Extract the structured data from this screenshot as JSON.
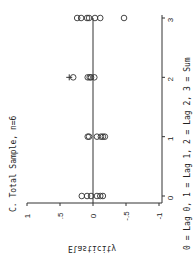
{
  "chart_data": {
    "type": "scatter",
    "orientation": "rotated-90-ccw",
    "title": "C. Total Sample, n=6",
    "xlabel": "0 = Lag 0, 1 = Lag 1, 2 = Lag 2, 3 = Sum",
    "ylabel": "Elasticity",
    "xlim": [
      0,
      3
    ],
    "ylim": [
      -1,
      1
    ],
    "x_ticks": [
      0,
      1,
      2,
      3
    ],
    "x_tick_labels": [
      "0",
      "1",
      "2",
      "3"
    ],
    "y_ticks": [
      1,
      0.5,
      0,
      -0.5,
      -1
    ],
    "y_tick_labels": [
      "1",
      ".5",
      "0",
      "-.5",
      "-1"
    ],
    "reference_line": {
      "y": 0
    },
    "grid": false,
    "series": [
      {
        "name": "estimates",
        "marker": "circle",
        "points": [
          {
            "x": 0,
            "y": 0.17
          },
          {
            "x": 0,
            "y": 0.09
          },
          {
            "x": 0,
            "y": 0.03
          },
          {
            "x": 0,
            "y": -0.06
          },
          {
            "x": 0,
            "y": -0.11
          },
          {
            "x": 0,
            "y": -0.15
          },
          {
            "x": 1,
            "y": 0.08
          },
          {
            "x": 1,
            "y": 0.06
          },
          {
            "x": 1,
            "y": -0.06
          },
          {
            "x": 1,
            "y": -0.12
          },
          {
            "x": 1,
            "y": -0.15
          },
          {
            "x": 1,
            "y": -0.18
          },
          {
            "x": 2,
            "y": 0.3
          },
          {
            "x": 2,
            "y": 0.08
          },
          {
            "x": 2,
            "y": 0.05
          },
          {
            "x": 2,
            "y": 0.03
          },
          {
            "x": 2,
            "y": -0.02
          },
          {
            "x": 3,
            "y": 0.24
          },
          {
            "x": 3,
            "y": 0.18
          },
          {
            "x": 3,
            "y": 0.09
          },
          {
            "x": 3,
            "y": 0.06
          },
          {
            "x": 3,
            "y": -0.03
          },
          {
            "x": 3,
            "y": -0.11
          },
          {
            "x": 3,
            "y": -0.47
          }
        ]
      },
      {
        "name": "other",
        "marker": "plus",
        "points": [
          {
            "x": 2,
            "y": 0.36
          }
        ]
      }
    ]
  }
}
